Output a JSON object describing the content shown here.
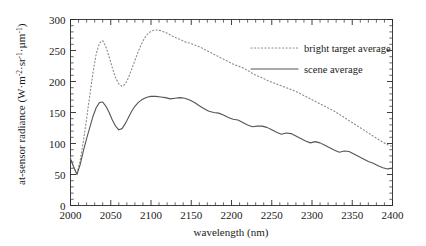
{
  "chart_data": {
    "type": "line",
    "title": "",
    "xlabel": "wavelength  (nm)",
    "ylabel": "at-sensor radiance (W·m-2·sr-1·µm-1)",
    "ylabel_parts": {
      "base": "at-sensor radiance (W·m",
      "sup1": "-2",
      "mid1": "·sr",
      "sup2": "-1",
      "mid2": "·µm",
      "sup3": "-1",
      "tail": ")"
    },
    "xlim": [
      2000,
      2400
    ],
    "ylim": [
      0,
      300
    ],
    "xticks": [
      2000,
      2050,
      2100,
      2150,
      2200,
      2250,
      2300,
      2350,
      2400
    ],
    "yticks": [
      0,
      50,
      100,
      150,
      200,
      250,
      300
    ],
    "xtick_labels": [
      "2000",
      "2050",
      "2100",
      "2150",
      "2200",
      "2250",
      "2300",
      "2350",
      "2400"
    ],
    "ytick_labels": [
      "0",
      "50",
      "100",
      "150",
      "200",
      "250",
      "300"
    ],
    "x_minor_step": 10,
    "y_minor_step": 10,
    "grid": false,
    "legend_position": "upper-right",
    "series": [
      {
        "name": "bright target average",
        "style": "dotted",
        "color": "#8c8c8c",
        "x": [
          2000,
          2004,
          2008,
          2012,
          2016,
          2020,
          2024,
          2028,
          2032,
          2036,
          2040,
          2044,
          2048,
          2052,
          2056,
          2060,
          2064,
          2068,
          2072,
          2076,
          2080,
          2084,
          2088,
          2092,
          2096,
          2100,
          2104,
          2108,
          2112,
          2116,
          2120,
          2124,
          2130,
          2136,
          2142,
          2148,
          2154,
          2160,
          2166,
          2172,
          2178,
          2184,
          2190,
          2196,
          2202,
          2208,
          2214,
          2220,
          2226,
          2232,
          2238,
          2244,
          2250,
          2256,
          2262,
          2268,
          2274,
          2280,
          2286,
          2292,
          2298,
          2304,
          2310,
          2316,
          2322,
          2328,
          2334,
          2340,
          2346,
          2352,
          2358,
          2364,
          2370,
          2376,
          2382,
          2388,
          2394,
          2400
        ],
        "y": [
          78,
          60,
          52,
          72,
          104,
          140,
          178,
          215,
          245,
          262,
          266,
          256,
          240,
          222,
          206,
          196,
          192,
          196,
          206,
          220,
          234,
          248,
          260,
          270,
          277,
          281,
          283,
          283,
          282,
          280,
          278,
          275,
          271,
          268,
          264,
          262,
          259,
          256,
          252,
          248,
          244,
          240,
          236,
          232,
          228,
          225,
          222,
          218,
          213,
          209,
          206,
          202,
          199,
          196,
          193,
          190,
          187,
          184,
          180,
          176,
          172,
          168,
          164,
          160,
          156,
          152,
          147,
          142,
          137,
          132,
          127,
          122,
          117,
          112,
          107,
          102,
          98,
          95
        ]
      },
      {
        "name": "scene average",
        "style": "solid",
        "color": "#555555",
        "x": [
          2000,
          2004,
          2008,
          2012,
          2016,
          2020,
          2024,
          2028,
          2032,
          2036,
          2040,
          2044,
          2048,
          2052,
          2056,
          2060,
          2064,
          2068,
          2072,
          2076,
          2080,
          2084,
          2088,
          2092,
          2096,
          2100,
          2106,
          2112,
          2118,
          2124,
          2130,
          2136,
          2142,
          2148,
          2154,
          2160,
          2166,
          2172,
          2178,
          2184,
          2190,
          2196,
          2202,
          2208,
          2214,
          2220,
          2226,
          2232,
          2238,
          2244,
          2250,
          2256,
          2262,
          2268,
          2274,
          2280,
          2286,
          2292,
          2298,
          2304,
          2310,
          2316,
          2322,
          2328,
          2334,
          2340,
          2346,
          2352,
          2358,
          2364,
          2370,
          2376,
          2382,
          2388,
          2394,
          2400
        ],
        "y": [
          75,
          62,
          50,
          66,
          88,
          108,
          126,
          144,
          158,
          166,
          167,
          160,
          150,
          138,
          128,
          122,
          124,
          132,
          142,
          152,
          160,
          166,
          170,
          173,
          175,
          176,
          176,
          175,
          174,
          172,
          173,
          174,
          173,
          170,
          166,
          161,
          156,
          152,
          150,
          149,
          146,
          142,
          139,
          138,
          134,
          130,
          127,
          128,
          128,
          126,
          122,
          118,
          115,
          117,
          116,
          112,
          108,
          104,
          101,
          103,
          101,
          97,
          93,
          89,
          86,
          88,
          87,
          83,
          79,
          75,
          71,
          68,
          64,
          61,
          59,
          60
        ]
      }
    ]
  },
  "legend": {
    "entries": [
      {
        "label": "bright target average",
        "style": "dotted"
      },
      {
        "label": "scene average",
        "style": "solid"
      }
    ]
  }
}
